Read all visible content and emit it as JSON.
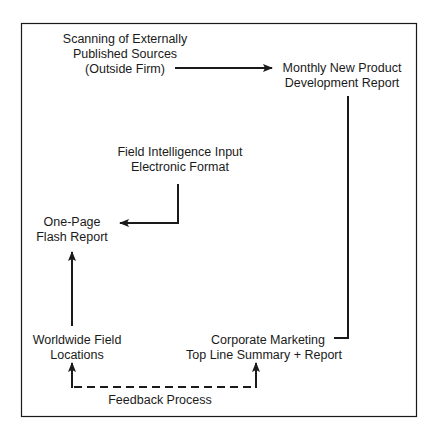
{
  "diagram": {
    "nodes": {
      "external_sources": {
        "lines": [
          "Scanning of Externally",
          "Published Sources",
          "(Outside Firm)"
        ]
      },
      "monthly_report": {
        "lines": [
          "Monthly New Product",
          "Development Report"
        ]
      },
      "field_intelligence": {
        "lines": [
          "Field Intelligence Input",
          "Electronic Format"
        ]
      },
      "flash_report": {
        "lines": [
          "One-Page",
          "Flash Report"
        ]
      },
      "field_locations": {
        "lines": [
          "Worldwide Field",
          "Locations"
        ]
      },
      "corporate_marketing": {
        "lines": [
          "Corporate Marketing",
          "Top Line Summary + Report"
        ]
      }
    },
    "feedback_label": "Feedback Process",
    "edges": [
      {
        "from": "external_sources",
        "to": "monthly_report",
        "style": "solid"
      },
      {
        "from": "monthly_report",
        "to": "corporate_marketing",
        "style": "solid"
      },
      {
        "from": "field_intelligence",
        "to": "flash_report",
        "style": "solid"
      },
      {
        "from": "field_locations",
        "to": "flash_report",
        "style": "solid"
      },
      {
        "from": "field_locations",
        "to": "corporate_marketing",
        "style": "dashed",
        "label": "Feedback Process",
        "bidirectional": true
      }
    ],
    "colors": {
      "line": "#1a1a1a",
      "background": "#ffffff"
    }
  }
}
